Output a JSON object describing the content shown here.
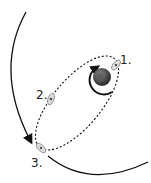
{
  "diagram": {
    "labels": [
      {
        "id": "1",
        "text": "1."
      },
      {
        "id": "2",
        "text": "2."
      },
      {
        "id": "3",
        "text": "3."
      }
    ],
    "elements": {
      "planet": "earth-globe-icon",
      "spacecraft": "spacecraft-icon",
      "transfer_orbit": "dashed-ellipse",
      "moon_orbit": "solid-arc-with-arrow",
      "parking_orbit": "circular-arrow"
    },
    "colors": {
      "line": "#111111",
      "planet_dark": "#3a3a3a",
      "planet_light": "#888888",
      "craft": "#bbbbbb"
    }
  }
}
